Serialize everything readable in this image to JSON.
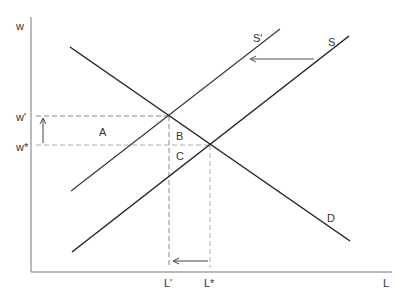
{
  "diagram": {
    "type": "labor-market supply shift",
    "axes": {
      "y_label": "w",
      "x_label": "L"
    },
    "curves": [
      {
        "id": "D",
        "label": "D"
      },
      {
        "id": "S",
        "label": "S"
      },
      {
        "id": "S_prime",
        "label": "S'"
      }
    ],
    "levels": {
      "w_prime": "w'",
      "w_star": "w*",
      "L_prime": "L'",
      "L_star": "L*"
    },
    "areas": {
      "a": "A",
      "b": "B",
      "c": "C"
    },
    "colors": {
      "line": "#222222",
      "dashed": "#888888",
      "text": "#333333"
    }
  }
}
